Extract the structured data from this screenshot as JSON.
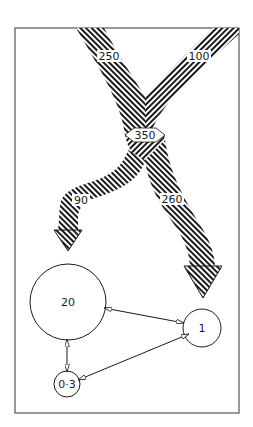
{
  "diagram": {
    "type": "flow-and-compartment",
    "frame": {
      "stroke": "#555555"
    },
    "flows": [
      {
        "id": "in-left",
        "label": "250",
        "direction": "down"
      },
      {
        "id": "in-right",
        "label": "100",
        "direction": "down"
      },
      {
        "id": "merged",
        "label": "350",
        "direction": "down"
      },
      {
        "id": "out-left",
        "label": "90",
        "direction": "down"
      },
      {
        "id": "out-right",
        "label": "260",
        "direction": "down"
      }
    ],
    "compartments": [
      {
        "id": "c20",
        "label": "20"
      },
      {
        "id": "c1",
        "label": "1"
      },
      {
        "id": "c03",
        "label": "0·3"
      }
    ],
    "exchanges": [
      {
        "from": "c20",
        "to": "c1",
        "bidirectional": true
      },
      {
        "from": "c20",
        "to": "c03",
        "bidirectional": true
      },
      {
        "from": "c03",
        "to": "c1",
        "bidirectional": true
      }
    ],
    "colors": {
      "ink": "#1a1a1a",
      "background": "#ffffff"
    }
  }
}
